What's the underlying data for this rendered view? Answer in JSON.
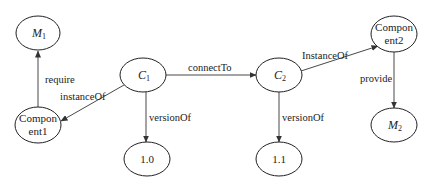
{
  "diagram": {
    "nodes": [
      {
        "id": "M1",
        "label": "M",
        "subscript": "1",
        "italic": true,
        "cx": 38,
        "cy": 33,
        "rx": 22,
        "ry": 17
      },
      {
        "id": "C1",
        "label": "C",
        "subscript": "1",
        "italic": true,
        "cx": 143,
        "cy": 75,
        "rx": 23,
        "ry": 17
      },
      {
        "id": "Component1",
        "label": "Compon",
        "label2": "ent1",
        "italic": false,
        "cx": 38,
        "cy": 125,
        "rx": 23,
        "ry": 18
      },
      {
        "id": "V10",
        "label": "1.0",
        "italic": false,
        "cx": 147,
        "cy": 159,
        "rx": 23,
        "ry": 17
      },
      {
        "id": "C2",
        "label": "C",
        "subscript": "2",
        "italic": true,
        "cx": 279,
        "cy": 75,
        "rx": 23,
        "ry": 17
      },
      {
        "id": "V11",
        "label": "1.1",
        "italic": false,
        "cx": 279,
        "cy": 159,
        "rx": 23,
        "ry": 17
      },
      {
        "id": "Component2",
        "label": "Compon",
        "label2": "ent2",
        "italic": false,
        "cx": 394,
        "cy": 34,
        "rx": 23,
        "ry": 18
      },
      {
        "id": "M2",
        "label": "M",
        "subscript": "2",
        "italic": true,
        "cx": 394,
        "cy": 125,
        "rx": 23,
        "ry": 17
      }
    ],
    "edges": [
      {
        "from": "Component1",
        "to": "M1",
        "label": "require"
      },
      {
        "from": "C1",
        "to": "Component1",
        "label": "instanceOf"
      },
      {
        "from": "C1",
        "to": "V10",
        "label": "versionOf"
      },
      {
        "from": "C1",
        "to": "C2",
        "label": "connectTo"
      },
      {
        "from": "C2",
        "to": "V11",
        "label": "versionOf"
      },
      {
        "from": "C2",
        "to": "Component2",
        "label": "InstanceOf"
      },
      {
        "from": "Component2",
        "to": "M2",
        "label": "provide"
      }
    ]
  },
  "labels": {
    "m1": "M",
    "m1_sub": "1",
    "c1": "C",
    "c1_sub": "1",
    "c2": "C",
    "c2_sub": "2",
    "m2": "M",
    "m2_sub": "2",
    "comp1_line1": "Compon",
    "comp1_line2": "ent1",
    "comp2_line1": "Compon",
    "comp2_line2": "ent2",
    "v10": "1.0",
    "v11": "1.1",
    "edge_require": "require",
    "edge_instanceOf": "instanceOf",
    "edge_versionOf_1": "versionOf",
    "edge_connectTo": "connectTo",
    "edge_versionOf_2": "versionOf",
    "edge_InstanceOf": "InstanceOf",
    "edge_provide": "provide"
  }
}
